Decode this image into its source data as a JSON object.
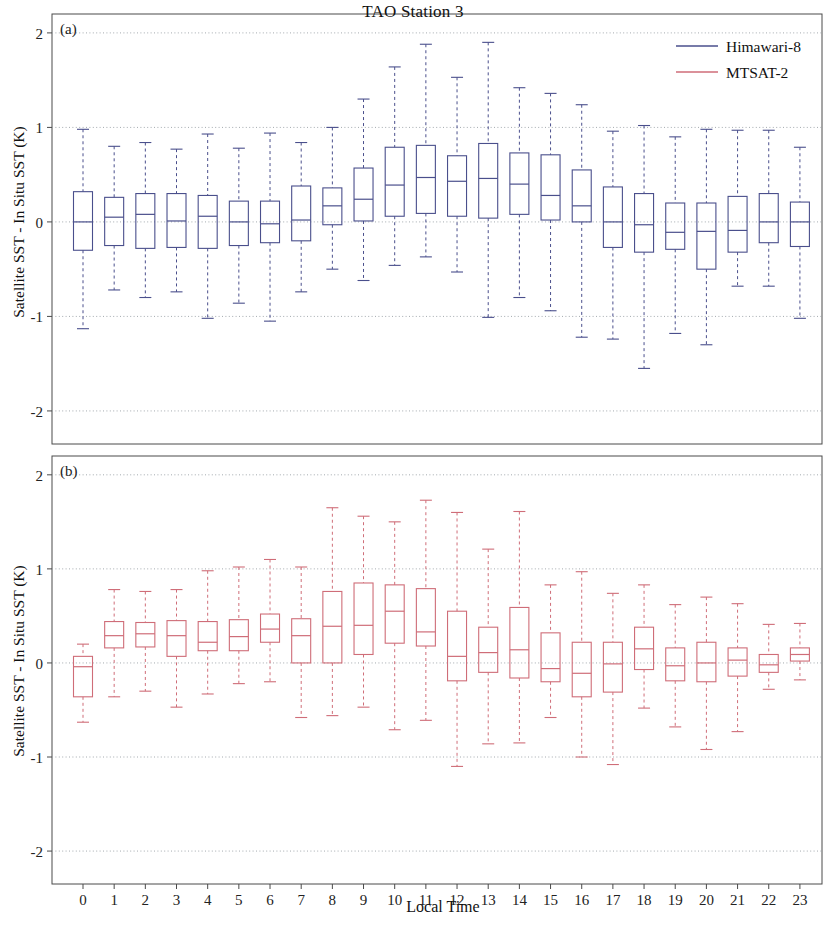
{
  "figure": {
    "title": "TAO Station 3",
    "xlabel": "Local Time",
    "ylabel": "Satellite SST - In Situ SST (K)",
    "panel_a_tag": "(a)",
    "panel_b_tag": "(b)"
  },
  "legend": {
    "position": "top-right",
    "entries": [
      {
        "label": "Himawari-8",
        "color": "#4a4f8c"
      },
      {
        "label": "MTSAT-2",
        "color": "#cf6d78"
      }
    ]
  },
  "axis": {
    "y_ticks": [
      "2",
      "1",
      "0",
      "-1",
      "-2"
    ],
    "x_ticks": [
      "0",
      "1",
      "2",
      "3",
      "4",
      "5",
      "6",
      "7",
      "8",
      "9",
      "10",
      "11",
      "12",
      "13",
      "14",
      "15",
      "16",
      "17",
      "18",
      "19",
      "20",
      "21",
      "22",
      "23"
    ]
  },
  "chart_data": [
    {
      "type": "box",
      "panel": "(a)",
      "title": "TAO Station 3",
      "series_name": "Himawari-8",
      "color": "#4a4f8c",
      "xlabel": "Local Time",
      "ylabel": "Satellite SST - In Situ SST (K)",
      "ylim": [
        -2.35,
        2.2
      ],
      "yticks": [
        2,
        1,
        0,
        -1,
        -2
      ],
      "grid": true,
      "categories": [
        0,
        1,
        2,
        3,
        4,
        5,
        6,
        7,
        8,
        9,
        10,
        11,
        12,
        13,
        14,
        15,
        16,
        17,
        18,
        19,
        20,
        21,
        22,
        23
      ],
      "boxes": [
        {
          "x": 0,
          "whislo": -1.13,
          "q1": -0.3,
          "med": 0.0,
          "q3": 0.32,
          "whishi": 0.98
        },
        {
          "x": 1,
          "whislo": -0.72,
          "q1": -0.25,
          "med": 0.05,
          "q3": 0.26,
          "whishi": 0.8
        },
        {
          "x": 2,
          "whislo": -0.8,
          "q1": -0.28,
          "med": 0.08,
          "q3": 0.3,
          "whishi": 0.84
        },
        {
          "x": 3,
          "whislo": -0.74,
          "q1": -0.27,
          "med": 0.01,
          "q3": 0.3,
          "whishi": 0.77
        },
        {
          "x": 4,
          "whislo": -1.02,
          "q1": -0.28,
          "med": 0.06,
          "q3": 0.28,
          "whishi": 0.93
        },
        {
          "x": 5,
          "whislo": -0.86,
          "q1": -0.25,
          "med": 0.0,
          "q3": 0.22,
          "whishi": 0.78
        },
        {
          "x": 6,
          "whislo": -1.05,
          "q1": -0.22,
          "med": -0.02,
          "q3": 0.22,
          "whishi": 0.94
        },
        {
          "x": 7,
          "whislo": -0.74,
          "q1": -0.2,
          "med": 0.02,
          "q3": 0.38,
          "whishi": 0.84
        },
        {
          "x": 8,
          "whislo": -0.5,
          "q1": -0.03,
          "med": 0.17,
          "q3": 0.36,
          "whishi": 1.0
        },
        {
          "x": 9,
          "whislo": -0.62,
          "q1": 0.01,
          "med": 0.24,
          "q3": 0.57,
          "whishi": 1.3
        },
        {
          "x": 10,
          "whislo": -0.46,
          "q1": 0.06,
          "med": 0.39,
          "q3": 0.79,
          "whishi": 1.64
        },
        {
          "x": 11,
          "whislo": -0.37,
          "q1": 0.09,
          "med": 0.47,
          "q3": 0.81,
          "whishi": 1.88
        },
        {
          "x": 12,
          "whislo": -0.53,
          "q1": 0.06,
          "med": 0.43,
          "q3": 0.7,
          "whishi": 1.53
        },
        {
          "x": 13,
          "whislo": -1.01,
          "q1": 0.04,
          "med": 0.46,
          "q3": 0.83,
          "whishi": 1.9
        },
        {
          "x": 14,
          "whislo": -0.8,
          "q1": 0.08,
          "med": 0.4,
          "q3": 0.73,
          "whishi": 1.42
        },
        {
          "x": 15,
          "whislo": -0.94,
          "q1": 0.02,
          "med": 0.28,
          "q3": 0.71,
          "whishi": 1.36
        },
        {
          "x": 16,
          "whislo": -1.22,
          "q1": 0.0,
          "med": 0.17,
          "q3": 0.55,
          "whishi": 1.24
        },
        {
          "x": 17,
          "whislo": -1.24,
          "q1": -0.27,
          "med": 0.0,
          "q3": 0.37,
          "whishi": 0.96
        },
        {
          "x": 18,
          "whislo": -1.55,
          "q1": -0.32,
          "med": -0.03,
          "q3": 0.3,
          "whishi": 1.02
        },
        {
          "x": 19,
          "whislo": -1.18,
          "q1": -0.29,
          "med": -0.11,
          "q3": 0.2,
          "whishi": 0.9
        },
        {
          "x": 20,
          "whislo": -1.3,
          "q1": -0.5,
          "med": -0.1,
          "q3": 0.2,
          "whishi": 0.98
        },
        {
          "x": 21,
          "whislo": -0.68,
          "q1": -0.32,
          "med": -0.09,
          "q3": 0.27,
          "whishi": 0.97
        },
        {
          "x": 22,
          "whislo": -0.68,
          "q1": -0.22,
          "med": 0.0,
          "q3": 0.3,
          "whishi": 0.97
        },
        {
          "x": 23,
          "whislo": -1.02,
          "q1": -0.26,
          "med": 0.0,
          "q3": 0.21,
          "whishi": 0.79
        }
      ]
    },
    {
      "type": "box",
      "panel": "(b)",
      "series_name": "MTSAT-2",
      "color": "#cf6d78",
      "xlabel": "Local Time",
      "ylabel": "Satellite SST - In Situ SST (K)",
      "ylim": [
        -2.35,
        2.2
      ],
      "yticks": [
        2,
        1,
        0,
        -1,
        -2
      ],
      "grid": true,
      "categories": [
        0,
        1,
        2,
        3,
        4,
        5,
        6,
        7,
        8,
        9,
        10,
        11,
        12,
        13,
        14,
        15,
        16,
        17,
        18,
        19,
        20,
        21,
        22,
        23
      ],
      "boxes": [
        {
          "x": 0,
          "whislo": -0.63,
          "q1": -0.36,
          "med": -0.04,
          "q3": 0.07,
          "whishi": 0.2
        },
        {
          "x": 1,
          "whislo": -0.36,
          "q1": 0.16,
          "med": 0.29,
          "q3": 0.44,
          "whishi": 0.78
        },
        {
          "x": 2,
          "whislo": -0.3,
          "q1": 0.17,
          "med": 0.31,
          "q3": 0.43,
          "whishi": 0.76
        },
        {
          "x": 3,
          "whislo": -0.47,
          "q1": 0.07,
          "med": 0.29,
          "q3": 0.45,
          "whishi": 0.78
        },
        {
          "x": 4,
          "whislo": -0.33,
          "q1": 0.13,
          "med": 0.22,
          "q3": 0.44,
          "whishi": 0.98
        },
        {
          "x": 5,
          "whislo": -0.22,
          "q1": 0.13,
          "med": 0.28,
          "q3": 0.46,
          "whishi": 1.02
        },
        {
          "x": 6,
          "whislo": -0.2,
          "q1": 0.22,
          "med": 0.36,
          "q3": 0.52,
          "whishi": 1.1
        },
        {
          "x": 7,
          "whislo": -0.58,
          "q1": 0.0,
          "med": 0.29,
          "q3": 0.47,
          "whishi": 1.02
        },
        {
          "x": 8,
          "whislo": -0.56,
          "q1": 0.0,
          "med": 0.39,
          "q3": 0.76,
          "whishi": 1.65
        },
        {
          "x": 9,
          "whislo": -0.47,
          "q1": 0.09,
          "med": 0.4,
          "q3": 0.85,
          "whishi": 1.56
        },
        {
          "x": 10,
          "whislo": -0.71,
          "q1": 0.21,
          "med": 0.55,
          "q3": 0.83,
          "whishi": 1.5
        },
        {
          "x": 11,
          "whislo": -0.61,
          "q1": 0.18,
          "med": 0.33,
          "q3": 0.79,
          "whishi": 1.73
        },
        {
          "x": 12,
          "whislo": -1.1,
          "q1": -0.19,
          "med": 0.07,
          "q3": 0.55,
          "whishi": 1.6
        },
        {
          "x": 13,
          "whislo": -0.86,
          "q1": -0.1,
          "med": 0.11,
          "q3": 0.38,
          "whishi": 1.21
        },
        {
          "x": 14,
          "whislo": -0.85,
          "q1": -0.16,
          "med": 0.14,
          "q3": 0.59,
          "whishi": 1.61
        },
        {
          "x": 15,
          "whislo": -0.58,
          "q1": -0.2,
          "med": -0.06,
          "q3": 0.32,
          "whishi": 0.83
        },
        {
          "x": 16,
          "whislo": -1.0,
          "q1": -0.36,
          "med": -0.11,
          "q3": 0.22,
          "whishi": 0.97
        },
        {
          "x": 17,
          "whislo": -1.08,
          "q1": -0.31,
          "med": -0.01,
          "q3": 0.22,
          "whishi": 0.74
        },
        {
          "x": 18,
          "whislo": -0.48,
          "q1": -0.07,
          "med": 0.15,
          "q3": 0.38,
          "whishi": 0.83
        },
        {
          "x": 19,
          "whislo": -0.68,
          "q1": -0.19,
          "med": -0.03,
          "q3": 0.16,
          "whishi": 0.62
        },
        {
          "x": 20,
          "whislo": -0.92,
          "q1": -0.2,
          "med": 0.0,
          "q3": 0.22,
          "whishi": 0.7
        },
        {
          "x": 21,
          "whislo": -0.73,
          "q1": -0.14,
          "med": 0.03,
          "q3": 0.16,
          "whishi": 0.63
        },
        {
          "x": 22,
          "whislo": -0.28,
          "q1": -0.1,
          "med": -0.02,
          "q3": 0.09,
          "whishi": 0.41
        },
        {
          "x": 23,
          "whislo": -0.18,
          "q1": 0.02,
          "med": 0.09,
          "q3": 0.16,
          "whishi": 0.42
        }
      ]
    }
  ]
}
